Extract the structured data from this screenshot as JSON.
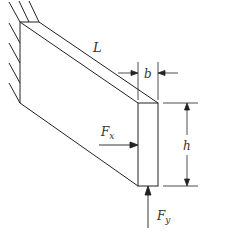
{
  "diagram": {
    "type": "cantilever-beam",
    "labels": {
      "length": "L",
      "width": "b",
      "height": "h",
      "force_x_main": "F",
      "force_x_sub": "x",
      "force_y_main": "F",
      "force_y_sub": "y"
    },
    "colors": {
      "stroke": "#222222",
      "text": "#333333",
      "background": "#ffffff"
    }
  }
}
